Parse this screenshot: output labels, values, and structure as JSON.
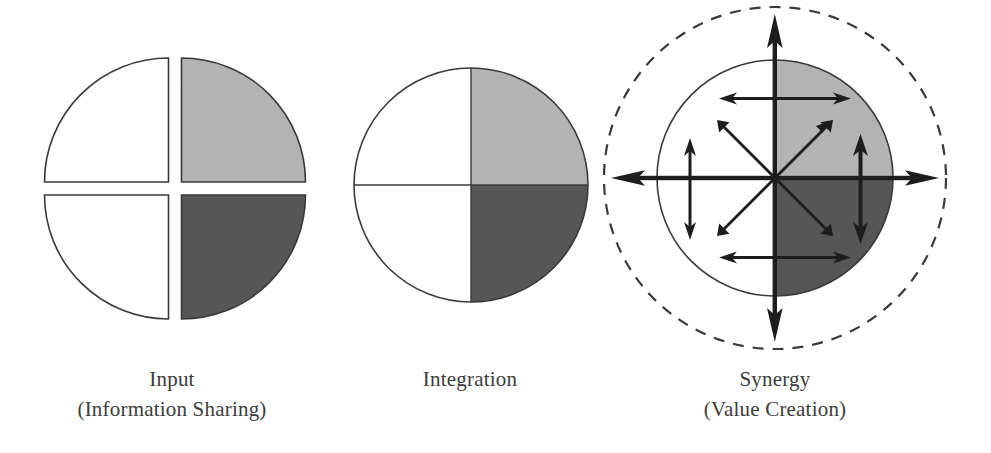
{
  "figure": {
    "background_color": "#ffffff",
    "stroke_color": "#3a3a3a",
    "light_gray": "#b3b3b3",
    "dark_gray": "#565656",
    "white_fill": "#ffffff"
  },
  "panels": [
    {
      "id": "input",
      "caption_line1": "Input",
      "caption_line2": "(Information Sharing)",
      "shape": "four-separated-quadrants",
      "center_x": 172,
      "center_y": 180,
      "radius": 120,
      "gap": 7,
      "quadrants": [
        {
          "name": "top-left",
          "fill": "#ffffff"
        },
        {
          "name": "top-right",
          "fill": "#b3b3b3"
        },
        {
          "name": "bottom-left",
          "fill": "#ffffff"
        },
        {
          "name": "bottom-right",
          "fill": "#565656"
        }
      ]
    },
    {
      "id": "integration",
      "caption_line1": "Integration",
      "caption_line2": "",
      "shape": "whole-circle-four-quadrants",
      "center_x": 470,
      "center_y": 185,
      "radius": 117,
      "quadrants": [
        {
          "name": "top-left",
          "fill": "#ffffff"
        },
        {
          "name": "top-right",
          "fill": "#b3b3b3"
        },
        {
          "name": "bottom-left",
          "fill": "#ffffff"
        },
        {
          "name": "bottom-right",
          "fill": "#565656"
        }
      ]
    },
    {
      "id": "synergy",
      "caption_line1": "Synergy",
      "caption_line2": "(Value Creation)",
      "shape": "circle-with-dashed-halo-and-arrows",
      "center_x": 775,
      "center_y": 178,
      "inner_radius": 118,
      "outer_dashed_radius": 171,
      "quadrants": [
        {
          "name": "top-left",
          "fill": "#ffffff"
        },
        {
          "name": "top-right",
          "fill": "#b3b3b3"
        },
        {
          "name": "bottom-left",
          "fill": "#ffffff"
        },
        {
          "name": "bottom-right",
          "fill": "#565656"
        }
      ],
      "arrows": {
        "axis_arrows": [
          "up",
          "down",
          "left",
          "right"
        ],
        "diagonal_double_arrows": 2,
        "horizontal_double_arrows": 2,
        "vertical_double_arrows": 2
      }
    }
  ]
}
